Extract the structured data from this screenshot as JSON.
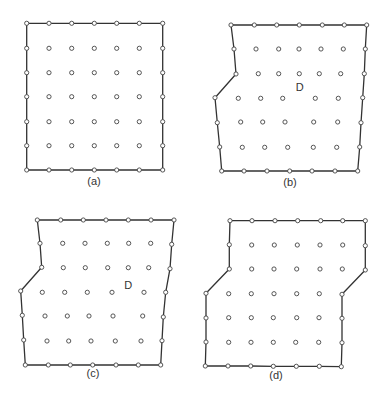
{
  "figure": {
    "node_radius": 2.1,
    "panels": [
      {
        "id": "a",
        "label": "(a)",
        "label_pos": [
          94,
          185
        ],
        "boundary": [
          [
            26.7,
            23.3
          ],
          [
            49,
            23.3
          ],
          [
            71.7,
            23.3
          ],
          [
            94.3,
            23.3
          ],
          [
            116.7,
            23.3
          ],
          [
            139.3,
            23.3
          ],
          [
            162.7,
            23.3
          ],
          [
            162.7,
            48.3
          ],
          [
            162.7,
            72.7
          ],
          [
            162.7,
            96.7
          ],
          [
            162.7,
            121.7
          ],
          [
            162.7,
            145.7
          ],
          [
            162.7,
            170
          ],
          [
            139.3,
            170
          ],
          [
            116.7,
            170
          ],
          [
            94.3,
            170
          ],
          [
            71.7,
            170
          ],
          [
            49,
            170
          ],
          [
            26.7,
            170
          ],
          [
            26.7,
            145.7
          ],
          [
            26.7,
            121.7
          ],
          [
            26.7,
            96.7
          ],
          [
            26.7,
            72.7
          ],
          [
            26.7,
            48.3
          ]
        ],
        "interior": [
          [
            49,
            48.3
          ],
          [
            71.7,
            48.3
          ],
          [
            94.3,
            48.3
          ],
          [
            116.7,
            48.3
          ],
          [
            139.3,
            48.3
          ],
          [
            49,
            72.7
          ],
          [
            71.7,
            72.7
          ],
          [
            94.3,
            72.7
          ],
          [
            116.7,
            72.7
          ],
          [
            139.3,
            72.7
          ],
          [
            49,
            96.7
          ],
          [
            71.7,
            96.7
          ],
          [
            94.3,
            96.7
          ],
          [
            116.7,
            96.7
          ],
          [
            139.3,
            96.7
          ],
          [
            49,
            121.7
          ],
          [
            71.7,
            121.7
          ],
          [
            94.3,
            121.7
          ],
          [
            116.7,
            121.7
          ],
          [
            139.3,
            121.7
          ],
          [
            49,
            145.7
          ],
          [
            71.7,
            145.7
          ],
          [
            94.3,
            145.7
          ],
          [
            116.7,
            145.7
          ],
          [
            139.3,
            145.7
          ]
        ],
        "region_label": null
      },
      {
        "id": "b",
        "label": "(b)",
        "label_pos": [
          290,
          186
        ],
        "boundary": [
          [
            231,
            25
          ],
          [
            254.3,
            25
          ],
          [
            276.7,
            25
          ],
          [
            299.3,
            25
          ],
          [
            322.3,
            25
          ],
          [
            344.3,
            25
          ],
          [
            366.7,
            25
          ],
          [
            365.3,
            49
          ],
          [
            364.3,
            73.7
          ],
          [
            362.7,
            97.7
          ],
          [
            361,
            122.7
          ],
          [
            359.7,
            147
          ],
          [
            357.7,
            171
          ],
          [
            335,
            171
          ],
          [
            312,
            171
          ],
          [
            289.7,
            171
          ],
          [
            267,
            171
          ],
          [
            244,
            171
          ],
          [
            221.7,
            171
          ],
          [
            219.7,
            147
          ],
          [
            217.3,
            122.7
          ],
          [
            215,
            97.7
          ],
          [
            236,
            74
          ],
          [
            234,
            49
          ]
        ],
        "interior": [
          [
            256,
            49
          ],
          [
            278.7,
            49
          ],
          [
            299,
            49
          ],
          [
            321,
            49
          ],
          [
            343.3,
            49
          ],
          [
            258.3,
            73.7
          ],
          [
            278.7,
            73.7
          ],
          [
            299.3,
            73.7
          ],
          [
            319.3,
            73.7
          ],
          [
            340.7,
            73.7
          ],
          [
            238.3,
            98.3
          ],
          [
            260.7,
            98.3
          ],
          [
            282.7,
            98.3
          ],
          [
            315.3,
            98.3
          ],
          [
            338.3,
            98.3
          ],
          [
            240.7,
            122
          ],
          [
            262.7,
            122
          ],
          [
            285,
            122
          ],
          [
            313.7,
            122
          ],
          [
            337.7,
            122
          ],
          [
            242.3,
            147.3
          ],
          [
            264.7,
            147.3
          ],
          [
            287.7,
            147.3
          ],
          [
            313.3,
            147.3
          ],
          [
            336.7,
            147.3
          ]
        ],
        "region_label": {
          "text": "D",
          "pos": [
            299.7,
            91
          ]
        }
      },
      {
        "id": "c",
        "label": "(c)",
        "label_pos": [
          93,
          377
        ],
        "boundary": [
          [
            37.3,
            220
          ],
          [
            60.7,
            220
          ],
          [
            83.3,
            220
          ],
          [
            106,
            220
          ],
          [
            128.3,
            220
          ],
          [
            151,
            220
          ],
          [
            174,
            220
          ],
          [
            171.7,
            244.3
          ],
          [
            170,
            268.7
          ],
          [
            165.7,
            292.3
          ],
          [
            163.3,
            317
          ],
          [
            162,
            340.7
          ],
          [
            160.7,
            365
          ],
          [
            138.3,
            365
          ],
          [
            116,
            365
          ],
          [
            92.7,
            365
          ],
          [
            70.3,
            365
          ],
          [
            48.3,
            365
          ],
          [
            25.3,
            365
          ],
          [
            23.7,
            340
          ],
          [
            22.3,
            315.3
          ],
          [
            20.7,
            291
          ],
          [
            41.7,
            267.3
          ],
          [
            40,
            243.3
          ]
        ],
        "interior": [
          [
            62.7,
            243.3
          ],
          [
            85,
            243.3
          ],
          [
            107.3,
            243.3
          ],
          [
            128.7,
            243.3
          ],
          [
            150.7,
            243.3
          ],
          [
            63.3,
            267.7
          ],
          [
            85.3,
            267.7
          ],
          [
            107.7,
            267.7
          ],
          [
            128.3,
            267.7
          ],
          [
            148.7,
            267.7
          ],
          [
            42.3,
            292.3
          ],
          [
            64.7,
            292.3
          ],
          [
            87.3,
            292.3
          ],
          [
            112,
            292.3
          ],
          [
            144,
            292.3
          ],
          [
            45,
            316
          ],
          [
            67.3,
            316
          ],
          [
            89,
            316
          ],
          [
            113,
            316
          ],
          [
            142.7,
            316
          ],
          [
            47,
            341
          ],
          [
            68.7,
            341
          ],
          [
            91,
            341
          ],
          [
            115.3,
            341
          ],
          [
            141,
            341
          ]
        ],
        "region_label": {
          "text": "D",
          "pos": [
            128.3,
            289
          ]
        }
      },
      {
        "id": "d",
        "label": "(d)",
        "label_pos": [
          276,
          379
        ],
        "boundary": [
          [
            230,
            220.7
          ],
          [
            252,
            220.7
          ],
          [
            275,
            220.7
          ],
          [
            297.7,
            220.7
          ],
          [
            320.7,
            220.7
          ],
          [
            342.7,
            220.7
          ],
          [
            365.3,
            220.7
          ],
          [
            365.3,
            245.7
          ],
          [
            365.3,
            270
          ],
          [
            342,
            294.3
          ],
          [
            342,
            318.3
          ],
          [
            342,
            342.7
          ],
          [
            341.3,
            366.7
          ],
          [
            319.3,
            366.3
          ],
          [
            296.3,
            366.3
          ],
          [
            273.3,
            366.3
          ],
          [
            250.7,
            366
          ],
          [
            228,
            366
          ],
          [
            205.3,
            366
          ],
          [
            206,
            342
          ],
          [
            206,
            318
          ],
          [
            206,
            293.3
          ],
          [
            229.3,
            269
          ],
          [
            229.3,
            244.7
          ]
        ],
        "interior": [
          [
            251.7,
            245
          ],
          [
            274.3,
            245
          ],
          [
            297.3,
            245
          ],
          [
            320,
            245
          ],
          [
            342.7,
            245
          ],
          [
            251.7,
            269
          ],
          [
            274,
            269
          ],
          [
            296.7,
            269
          ],
          [
            320,
            269
          ],
          [
            342.3,
            269
          ],
          [
            228.7,
            293.7
          ],
          [
            251.3,
            293.7
          ],
          [
            274,
            293.7
          ],
          [
            296.7,
            293.7
          ],
          [
            319.3,
            293.7
          ],
          [
            228.7,
            317.7
          ],
          [
            251.3,
            317.7
          ],
          [
            273.3,
            317.7
          ],
          [
            296.7,
            317.7
          ],
          [
            319,
            317.7
          ],
          [
            228.7,
            342.3
          ],
          [
            251,
            342.3
          ],
          [
            273.3,
            342.3
          ],
          [
            295.7,
            342.3
          ],
          [
            318.7,
            342.3
          ]
        ],
        "region_label": null
      }
    ]
  }
}
